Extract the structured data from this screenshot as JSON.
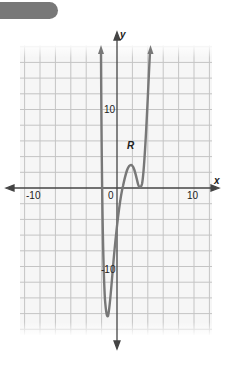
{
  "header": {
    "tab_color": "#787878"
  },
  "chart_data": {
    "type": "line",
    "title": "",
    "xlabel": "x",
    "ylabel": "y",
    "xlim": [
      -12.5,
      12.5
    ],
    "ylim": [
      -18,
      18
    ],
    "grid": true,
    "grid_step": 2,
    "x_tick_labels": [
      "-10",
      "0",
      "10"
    ],
    "y_tick_labels": [
      "10",
      "-10"
    ],
    "annotations": [
      {
        "text": "R",
        "x": 1.8,
        "y": 5.5,
        "note": "labels local maximum"
      }
    ],
    "series": [
      {
        "name": "polynomial curve",
        "points": [
          {
            "x": -2.0,
            "y": 18
          },
          {
            "x": -1.8,
            "y": 5
          },
          {
            "x": -1.5,
            "y": -10
          },
          {
            "x": -1.3,
            "y": -16.5
          },
          {
            "x": -0.8,
            "y": -14
          },
          {
            "x": 0.0,
            "y": -8
          },
          {
            "x": 0.8,
            "y": 0
          },
          {
            "x": 1.8,
            "y": 2.9
          },
          {
            "x": 2.4,
            "y": 1.5
          },
          {
            "x": 3.0,
            "y": 0
          },
          {
            "x": 3.6,
            "y": 4
          },
          {
            "x": 4.3,
            "y": 18
          }
        ],
        "color": "#777777"
      }
    ],
    "axis_color": "#444444",
    "grid_color": "#c8c8c8"
  }
}
